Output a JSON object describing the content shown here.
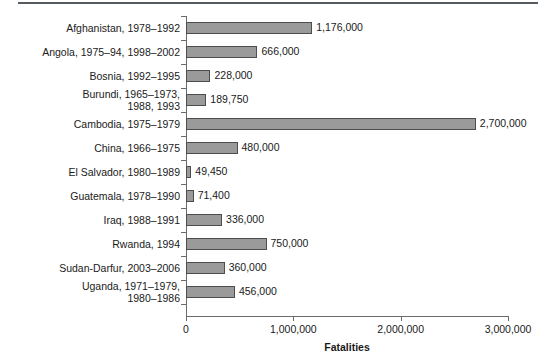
{
  "chart_data": {
    "type": "bar",
    "orientation": "horizontal",
    "title": "",
    "xlabel": "Fatalities",
    "ylabel": "",
    "xlim": [
      0,
      3000000
    ],
    "xticks": [
      0,
      1000000,
      2000000,
      3000000
    ],
    "xtick_labels": [
      "0",
      "1,000,000",
      "2,000,000",
      "3,000,000"
    ],
    "grid": false,
    "legend": null,
    "bar_color": "#9a9a9a",
    "bar_edge_color": "#4d4d4d",
    "categories": [
      "Afghanistan, 1978–1992",
      "Angola, 1975–94, 1998–2002",
      "Bosnia, 1992–1995",
      "Burundi, 1965–1973,\n1988, 1993",
      "Cambodia, 1975–1979",
      "China, 1966–1975",
      "El Salvador, 1980–1989",
      "Guatemala, 1978–1990",
      "Iraq, 1988–1991",
      "Rwanda, 1994",
      "Sudan-Darfur, 2003–2006",
      "Uganda, 1971–1979,\n1980–1986"
    ],
    "values": [
      1176000,
      666000,
      228000,
      189750,
      2700000,
      480000,
      49450,
      71400,
      336000,
      750000,
      360000,
      456000
    ],
    "value_labels": [
      "1,176,000",
      "666,000",
      "228,000",
      "189,750",
      "2,700,000",
      "480,000",
      "49,450",
      "71,400",
      "336,000",
      "750,000",
      "360,000",
      "456,000"
    ]
  }
}
